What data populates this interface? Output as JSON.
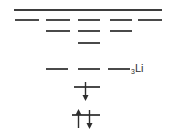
{
  "figure": {
    "kind": "atomic-energy-level-diagram",
    "element_label": {
      "atomic_number": "3",
      "symbol": "Li",
      "full": "₃Li"
    },
    "colors": {
      "level_line": "#4a4a4a",
      "continuum_line": "#3d3d3d",
      "arrow": "#2e2e2e",
      "text": "#2e2e2e",
      "background": "#ffffff"
    },
    "continuum": {
      "name": "ionization-continuum",
      "x": 14,
      "y": 9,
      "width": 148,
      "height": 2
    },
    "level_rows": [
      {
        "row": 1,
        "y": 19,
        "lines": [
          {
            "column": 1,
            "x": 15,
            "width": 24,
            "height": 2
          },
          {
            "column": 2,
            "x": 46,
            "width": 24,
            "height": 2
          },
          {
            "column": 3,
            "x": 78,
            "width": 22,
            "height": 2
          },
          {
            "column": 4,
            "x": 110,
            "width": 22,
            "height": 2
          },
          {
            "column": 5,
            "x": 138,
            "width": 24,
            "height": 2
          }
        ]
      },
      {
        "row": 2,
        "y": 30,
        "lines": [
          {
            "column": 2,
            "x": 46,
            "width": 24,
            "height": 2
          },
          {
            "column": 3,
            "x": 78,
            "width": 22,
            "height": 2
          },
          {
            "column": 4,
            "x": 110,
            "width": 22,
            "height": 2
          }
        ]
      },
      {
        "row": 3,
        "y": 42,
        "lines": [
          {
            "column": 3,
            "x": 78,
            "width": 22,
            "height": 2
          }
        ]
      },
      {
        "row": 4,
        "y": 68,
        "lines": [
          {
            "column": 2,
            "x": 46,
            "width": 22,
            "height": 2
          },
          {
            "column": 3,
            "x": 78,
            "width": 22,
            "height": 2
          },
          {
            "column": 4,
            "x": 108,
            "width": 22,
            "height": 2
          }
        ]
      }
    ],
    "occupied_levels": [
      {
        "name": "level-single-electron",
        "x": 74,
        "y": 86,
        "width": 26,
        "height": 2,
        "electrons": [
          {
            "spin": "down",
            "x": 85,
            "top": 81,
            "height": 20
          }
        ]
      },
      {
        "name": "level-paired-electrons",
        "x": 72,
        "y": 114,
        "width": 28,
        "height": 2,
        "electrons": [
          {
            "spin": "up",
            "x": 78,
            "top": 109,
            "height": 20
          },
          {
            "spin": "down",
            "x": 89,
            "top": 109,
            "height": 20
          }
        ]
      }
    ],
    "label_position": {
      "x": 131,
      "y": 59
    }
  }
}
